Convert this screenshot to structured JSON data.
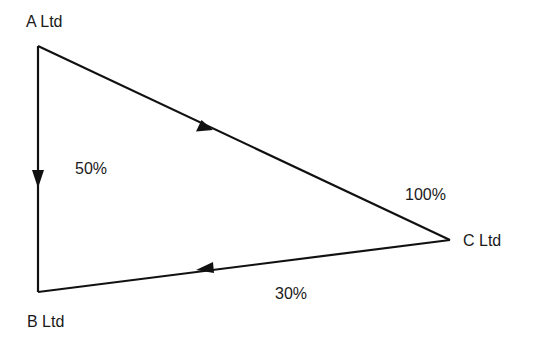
{
  "diagram": {
    "type": "ownership-triangle",
    "line_color": "#111111",
    "nodes": [
      {
        "id": "A",
        "label": "A Ltd"
      },
      {
        "id": "B",
        "label": "B Ltd"
      },
      {
        "id": "C",
        "label": "C Ltd"
      }
    ],
    "edges": [
      {
        "from": "A",
        "to": "B",
        "label": "50%"
      },
      {
        "from": "A",
        "to": "C",
        "label": "100%"
      },
      {
        "from": "C",
        "to": "B",
        "label": "30%"
      }
    ]
  }
}
